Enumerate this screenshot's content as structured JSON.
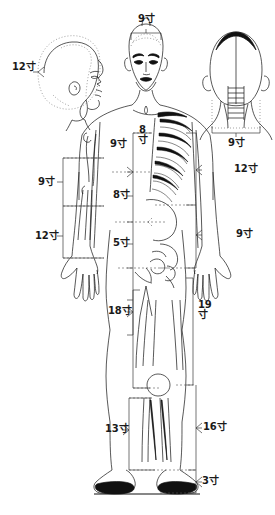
{
  "diagram": {
    "unit": "寸",
    "views": [
      {
        "name": "head-lateral-view",
        "label": "head-side-profile"
      },
      {
        "name": "head-frontal-view",
        "label": "head-front"
      },
      {
        "name": "head-posterior-view",
        "label": "head-back"
      },
      {
        "name": "body-frontal-view",
        "label": "full-body-front"
      }
    ]
  },
  "measurements": {
    "head_side_circumference": "12寸",
    "head_front_width": "9寸",
    "head_back_width": "9寸",
    "upper_arm": "9寸",
    "forearm": "12寸",
    "axilla_to_elbow": "9寸",
    "chest_sternum": "8寸",
    "epigastrium": "8寸",
    "lower_abdomen": "5寸",
    "shoulder_to_elbow_right": "12寸",
    "elbow_to_wrist_right": "9寸",
    "hip_to_knee": "18寸",
    "greater_trochanter_to_knee": "19寸",
    "knee_to_ankle": "13寸",
    "knee_to_ankle_lateral": "16寸",
    "ankle_to_sole": "3寸"
  },
  "labels": {
    "head_side": "12寸",
    "head_top": "9寸",
    "head_back": "9寸",
    "arm_upper_left": "9寸",
    "arm_lower_left": "12寸",
    "chest_left": "9寸",
    "sternum_num": "8",
    "sternum_unit": "寸",
    "abdomen_upper": "8寸",
    "abdomen_lower": "5寸",
    "arm_right_upper": "12寸",
    "arm_right_lower": "9寸",
    "thigh": "18寸",
    "leg_lateral_num": "19",
    "leg_lateral_unit": "寸",
    "shank": "13寸",
    "shank_lateral": "16寸",
    "foot": "3寸"
  },
  "colors": {
    "ink": "#111111",
    "bracket": "#3a3a3a",
    "dashed": "#555555",
    "background": "#ffffff"
  }
}
